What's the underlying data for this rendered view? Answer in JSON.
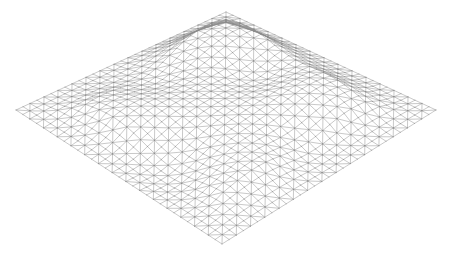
{
  "scene": {
    "type": "wireframe-terrain",
    "background": "#ffffff",
    "line_color": "#8a8a8a",
    "line_opacity": 0.85,
    "line_width": 0.55,
    "grid_size": 30,
    "corners": {
      "top": [
        226,
        12
      ],
      "right": [
        436,
        110
      ],
      "bottom": [
        222,
        244
      ],
      "left": [
        16,
        110
      ]
    },
    "height_scale": 14,
    "bumps": [
      {
        "u": 0.15,
        "v": 0.3,
        "r": 0.18,
        "h": 1.6
      },
      {
        "u": 0.35,
        "v": 0.15,
        "r": 0.15,
        "h": 1.2
      },
      {
        "u": 0.5,
        "v": 0.5,
        "r": 0.22,
        "h": 1.0
      },
      {
        "u": 0.7,
        "v": 0.25,
        "r": 0.16,
        "h": 1.4
      },
      {
        "u": 0.8,
        "v": 0.7,
        "r": 0.18,
        "h": 0.9
      },
      {
        "u": 0.3,
        "v": 0.75,
        "r": 0.16,
        "h": 1.1
      },
      {
        "u": 0.6,
        "v": 0.85,
        "r": 0.14,
        "h": -0.8
      },
      {
        "u": 0.45,
        "v": 0.3,
        "r": 0.1,
        "h": -0.9
      },
      {
        "u": 0.2,
        "v": 0.55,
        "r": 0.12,
        "h": -0.7
      },
      {
        "u": 0.85,
        "v": 0.45,
        "r": 0.12,
        "h": -0.6
      }
    ]
  }
}
